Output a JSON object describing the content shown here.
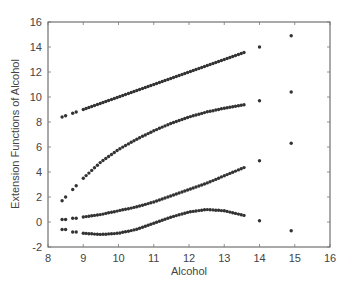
{
  "chart_data": {
    "type": "scatter",
    "title": "",
    "xlabel": "Alcohol",
    "ylabel": "Extension Functions of Alcohol",
    "xlim": [
      8,
      16
    ],
    "ylim": [
      -2,
      16
    ],
    "xticks": [
      8,
      9,
      10,
      11,
      12,
      13,
      14,
      15,
      16
    ],
    "yticks": [
      -2,
      0,
      2,
      4,
      6,
      8,
      10,
      12,
      14,
      16
    ],
    "grid": false,
    "legend": null,
    "marker_color": "#333333",
    "series": [
      {
        "name": "h1 (linear)",
        "points": [
          [
            8.4,
            8.4
          ],
          [
            8.5,
            8.5
          ],
          [
            8.7,
            8.7
          ],
          [
            8.8,
            8.8
          ],
          [
            9.0,
            9.0
          ],
          [
            9.5,
            9.5
          ],
          [
            10.0,
            10.0
          ],
          [
            10.5,
            10.5
          ],
          [
            11.0,
            11.0
          ],
          [
            11.5,
            11.5
          ],
          [
            12.0,
            12.0
          ],
          [
            12.5,
            12.5
          ],
          [
            13.0,
            13.0
          ],
          [
            13.6,
            13.6
          ],
          [
            14.0,
            14.0
          ],
          [
            14.9,
            14.9
          ]
        ]
      },
      {
        "name": "h2",
        "points": [
          [
            8.4,
            1.7
          ],
          [
            8.5,
            2.0
          ],
          [
            8.7,
            2.6
          ],
          [
            8.8,
            2.9
          ],
          [
            9.0,
            3.5
          ],
          [
            9.5,
            4.8
          ],
          [
            10.0,
            5.8
          ],
          [
            10.5,
            6.6
          ],
          [
            11.0,
            7.3
          ],
          [
            11.5,
            7.9
          ],
          [
            12.0,
            8.4
          ],
          [
            12.5,
            8.8
          ],
          [
            13.0,
            9.1
          ],
          [
            13.6,
            9.4
          ],
          [
            14.0,
            9.7
          ],
          [
            14.9,
            10.4
          ]
        ]
      },
      {
        "name": "h3",
        "points": [
          [
            8.4,
            0.2
          ],
          [
            8.5,
            0.2
          ],
          [
            8.7,
            0.3
          ],
          [
            8.8,
            0.3
          ],
          [
            9.0,
            0.4
          ],
          [
            9.5,
            0.6
          ],
          [
            10.0,
            0.9
          ],
          [
            10.5,
            1.2
          ],
          [
            11.0,
            1.6
          ],
          [
            11.5,
            2.1
          ],
          [
            12.0,
            2.6
          ],
          [
            12.5,
            3.1
          ],
          [
            13.0,
            3.7
          ],
          [
            13.6,
            4.4
          ],
          [
            14.0,
            4.9
          ],
          [
            14.9,
            6.3
          ]
        ]
      },
      {
        "name": "h4",
        "points": [
          [
            8.4,
            -0.6
          ],
          [
            8.5,
            -0.6
          ],
          [
            8.7,
            -0.8
          ],
          [
            8.8,
            -0.8
          ],
          [
            9.0,
            -0.9
          ],
          [
            9.5,
            -1.0
          ],
          [
            10.0,
            -0.9
          ],
          [
            10.5,
            -0.6
          ],
          [
            11.0,
            -0.1
          ],
          [
            11.5,
            0.4
          ],
          [
            12.0,
            0.8
          ],
          [
            12.5,
            1.0
          ],
          [
            13.0,
            0.9
          ],
          [
            13.6,
            0.5
          ],
          [
            14.0,
            0.1
          ],
          [
            14.9,
            -0.7
          ]
        ]
      }
    ]
  }
}
